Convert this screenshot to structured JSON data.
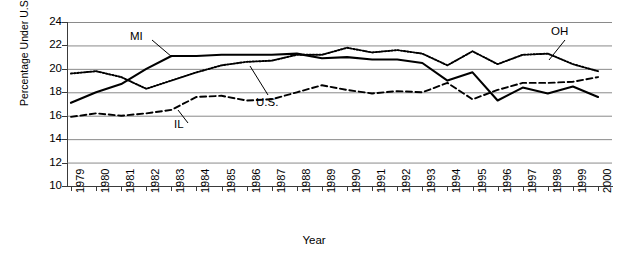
{
  "chart_data": {
    "type": "line",
    "title": "",
    "xlabel": "Year",
    "ylabel": "Percentage Under U.S. 20th Percentile",
    "ylim": [
      10,
      24
    ],
    "ytick_step": 2,
    "yticks": [
      24,
      22,
      20,
      18,
      16,
      14,
      12,
      10
    ],
    "grid": true,
    "grid_axis": "y",
    "legend_position": "inline-annotations",
    "categories": [
      1979,
      1980,
      1981,
      1982,
      1983,
      1984,
      1985,
      1986,
      1987,
      1988,
      1989,
      1990,
      1991,
      1992,
      1993,
      1994,
      1995,
      1996,
      1997,
      1998,
      1999,
      2000
    ],
    "series": [
      {
        "name": "MI",
        "style": "solid",
        "color": "#000000",
        "values": [
          17.1,
          18.0,
          18.7,
          20.0,
          21.1,
          21.1,
          21.2,
          21.2,
          21.2,
          21.3,
          20.9,
          21.0,
          20.8,
          20.8,
          20.5,
          19.0,
          19.7,
          17.3,
          18.4,
          17.9,
          18.5,
          17.6
        ]
      },
      {
        "name": "OH",
        "style": "dotted",
        "color": "#000000",
        "values": [
          19.6,
          19.8,
          19.3,
          18.3,
          19.0,
          19.7,
          20.3,
          20.6,
          20.7,
          21.2,
          21.2,
          21.8,
          21.4,
          21.6,
          21.3,
          20.3,
          21.5,
          20.4,
          21.2,
          21.3,
          20.4,
          19.8
        ]
      },
      {
        "name": "U.S.",
        "style": "dotted-fine",
        "color": "#000000",
        "values": [
          19.6,
          19.8,
          19.3,
          18.3,
          19.0,
          19.7,
          20.3,
          20.6,
          20.7,
          21.2,
          21.2,
          21.8,
          21.4,
          21.6,
          21.3,
          20.3,
          21.5,
          20.4,
          21.2,
          21.3,
          20.4,
          19.8
        ]
      },
      {
        "name": "IL",
        "style": "dashed",
        "color": "#000000",
        "values": [
          15.9,
          16.2,
          16.0,
          16.2,
          16.5,
          17.6,
          17.7,
          17.3,
          17.4,
          18.0,
          18.6,
          18.2,
          17.9,
          18.1,
          18.0,
          18.8,
          17.4,
          18.2,
          18.8,
          18.8,
          18.9,
          19.3
        ]
      }
    ],
    "annotations": [
      {
        "text": "MI",
        "series": "MI"
      },
      {
        "text": "OH",
        "series": "OH"
      },
      {
        "text": "U.S.",
        "series": "U.S."
      },
      {
        "text": "IL",
        "series": "IL"
      }
    ]
  }
}
